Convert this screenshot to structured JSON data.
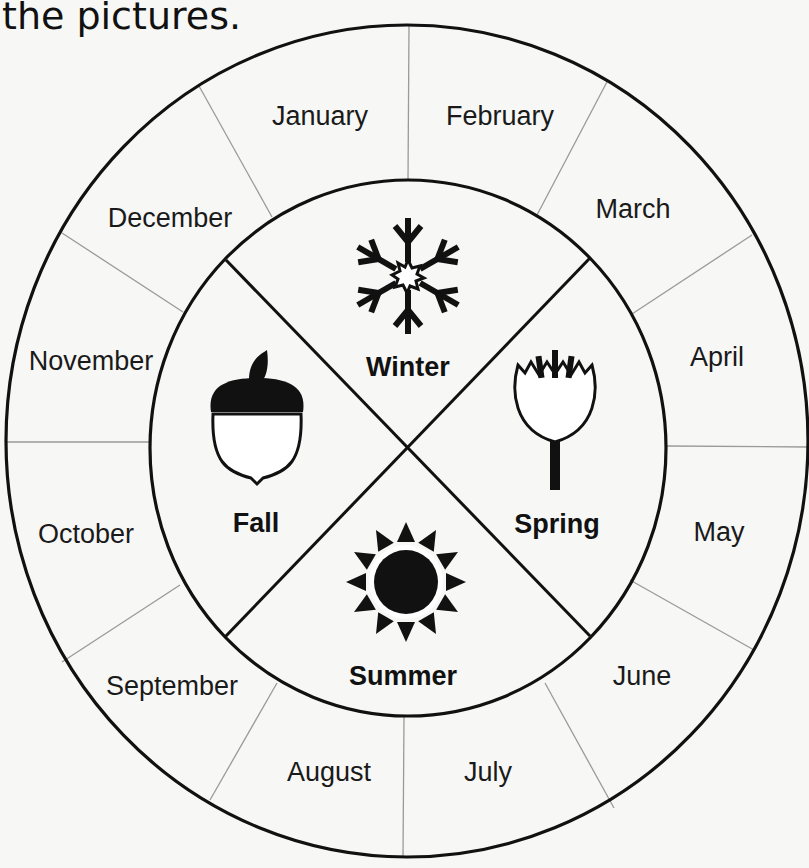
{
  "heading": {
    "text": "the pictures."
  },
  "diagram": {
    "type": "seasons-wheel",
    "colors": {
      "line": "#111111",
      "divider": "#9a9a9a",
      "background": "#f7f7f6"
    },
    "months": [
      {
        "label": "January",
        "x": 320,
        "y": 125
      },
      {
        "label": "February",
        "x": 500,
        "y": 125
      },
      {
        "label": "March",
        "x": 633,
        "y": 218
      },
      {
        "label": "April",
        "x": 717,
        "y": 366
      },
      {
        "label": "May",
        "x": 719,
        "y": 541
      },
      {
        "label": "June",
        "x": 642,
        "y": 685
      },
      {
        "label": "July",
        "x": 488,
        "y": 781
      },
      {
        "label": "August",
        "x": 329,
        "y": 781
      },
      {
        "label": "September",
        "x": 172,
        "y": 695
      },
      {
        "label": "October",
        "x": 86,
        "y": 543
      },
      {
        "label": "November",
        "x": 91,
        "y": 370
      },
      {
        "label": "December",
        "x": 170,
        "y": 227
      }
    ],
    "seasons": {
      "winter": {
        "label": "Winter",
        "icon": "snowflake-icon"
      },
      "spring": {
        "label": "Spring",
        "icon": "flower-bud-icon"
      },
      "summer": {
        "label": "Summer",
        "icon": "sun-icon"
      },
      "fall": {
        "label": "Fall",
        "icon": "acorn-icon"
      }
    }
  }
}
